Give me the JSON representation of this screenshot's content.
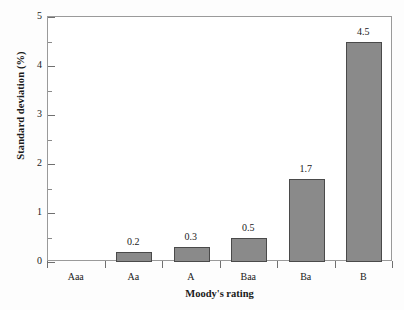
{
  "chart_data": {
    "type": "bar",
    "title": "",
    "xlabel": "Moody's  rating",
    "ylabel": "Standard deviation (%)",
    "categories": [
      "Aaa",
      "Aa",
      "A",
      "Baa",
      "Ba",
      "B"
    ],
    "values": [
      0,
      0.2,
      0.3,
      0.5,
      1.7,
      4.5
    ],
    "data_labels": [
      "",
      "0.2",
      "0.3",
      "0.5",
      "1.7",
      "4.5"
    ],
    "ylim": [
      0,
      5
    ],
    "ytick_labels": [
      "0",
      "1",
      "2",
      "3",
      "4",
      "5"
    ],
    "ytick_values": [
      0,
      1,
      2,
      3,
      4,
      5
    ],
    "yminor_values": [
      0.5,
      1.5,
      2.5,
      3.5,
      4.5
    ],
    "grid": false,
    "legend": null,
    "bar_color": "#8a8a8a",
    "bar_edge_color": "#4a4a4a",
    "frame_color": "#9a9a9a",
    "background": "#ffffff"
  }
}
